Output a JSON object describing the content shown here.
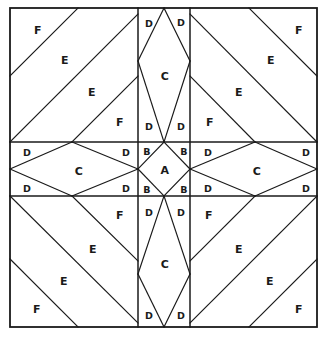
{
  "diagram": {
    "type": "quilt-block-template",
    "colors": {
      "line": "#1a1a1a",
      "background": "#ffffff",
      "label": "#1a1a1a"
    },
    "frame": {
      "x": 10,
      "y": 8,
      "width": 307,
      "height": 319
    },
    "grid": {
      "vertical_lines": [
        138,
        190
      ],
      "horizontal_lines": [
        142,
        196
      ],
      "columns": [
        10,
        138,
        190,
        317
      ],
      "rows": [
        8,
        142,
        196,
        327
      ]
    },
    "piece_types": [
      {
        "letter": "A",
        "count": 1,
        "shape": "center square on point"
      },
      {
        "letter": "B",
        "count": 4,
        "shape": "small corner triangle"
      },
      {
        "letter": "C",
        "count": 4,
        "shape": "long diamond"
      },
      {
        "letter": "D",
        "count": 16,
        "shape": "small triangle"
      },
      {
        "letter": "E",
        "count": 8,
        "shape": "large diagonal band"
      },
      {
        "letter": "F",
        "count": 8,
        "shape": "corner triangle"
      }
    ],
    "labels": [
      {
        "letter": "F",
        "x": 38,
        "y": 30,
        "size": "normal"
      },
      {
        "letter": "E",
        "x": 65,
        "y": 60,
        "size": "normal"
      },
      {
        "letter": "E",
        "x": 92,
        "y": 92,
        "size": "normal"
      },
      {
        "letter": "F",
        "x": 120,
        "y": 122,
        "size": "normal"
      },
      {
        "letter": "D",
        "x": 149,
        "y": 23,
        "size": "sm"
      },
      {
        "letter": "D",
        "x": 181,
        "y": 22,
        "size": "sm"
      },
      {
        "letter": "C",
        "x": 165,
        "y": 76,
        "size": "normal"
      },
      {
        "letter": "D",
        "x": 149,
        "y": 126,
        "size": "sm"
      },
      {
        "letter": "D",
        "x": 181,
        "y": 126,
        "size": "sm"
      },
      {
        "letter": "F",
        "x": 299,
        "y": 30,
        "size": "normal"
      },
      {
        "letter": "E",
        "x": 271,
        "y": 60,
        "size": "normal"
      },
      {
        "letter": "E",
        "x": 239,
        "y": 92,
        "size": "normal"
      },
      {
        "letter": "F",
        "x": 210,
        "y": 122,
        "size": "normal"
      },
      {
        "letter": "D",
        "x": 27,
        "y": 152,
        "size": "sm"
      },
      {
        "letter": "C",
        "x": 79,
        "y": 171,
        "size": "normal"
      },
      {
        "letter": "D",
        "x": 126,
        "y": 152,
        "size": "sm"
      },
      {
        "letter": "D",
        "x": 27,
        "y": 188,
        "size": "sm"
      },
      {
        "letter": "D",
        "x": 126,
        "y": 188,
        "size": "sm"
      },
      {
        "letter": "B",
        "x": 147,
        "y": 151,
        "size": "sm"
      },
      {
        "letter": "B",
        "x": 184,
        "y": 151,
        "size": "sm"
      },
      {
        "letter": "A",
        "x": 165,
        "y": 170,
        "size": "normal"
      },
      {
        "letter": "B",
        "x": 147,
        "y": 189,
        "size": "sm"
      },
      {
        "letter": "B",
        "x": 184,
        "y": 189,
        "size": "sm"
      },
      {
        "letter": "D",
        "x": 208,
        "y": 152,
        "size": "sm"
      },
      {
        "letter": "C",
        "x": 257,
        "y": 171,
        "size": "normal"
      },
      {
        "letter": "D",
        "x": 306,
        "y": 152,
        "size": "sm"
      },
      {
        "letter": "D",
        "x": 208,
        "y": 188,
        "size": "sm"
      },
      {
        "letter": "D",
        "x": 306,
        "y": 188,
        "size": "sm"
      },
      {
        "letter": "F",
        "x": 120,
        "y": 215,
        "size": "normal"
      },
      {
        "letter": "E",
        "x": 93,
        "y": 249,
        "size": "normal"
      },
      {
        "letter": "E",
        "x": 64,
        "y": 281,
        "size": "normal"
      },
      {
        "letter": "F",
        "x": 37,
        "y": 309,
        "size": "normal"
      },
      {
        "letter": "D",
        "x": 149,
        "y": 212,
        "size": "sm"
      },
      {
        "letter": "D",
        "x": 181,
        "y": 212,
        "size": "sm"
      },
      {
        "letter": "C",
        "x": 165,
        "y": 264,
        "size": "normal"
      },
      {
        "letter": "D",
        "x": 149,
        "y": 315,
        "size": "sm"
      },
      {
        "letter": "D",
        "x": 181,
        "y": 315,
        "size": "sm"
      },
      {
        "letter": "F",
        "x": 209,
        "y": 215,
        "size": "normal"
      },
      {
        "letter": "E",
        "x": 239,
        "y": 249,
        "size": "normal"
      },
      {
        "letter": "E",
        "x": 270,
        "y": 281,
        "size": "normal"
      },
      {
        "letter": "F",
        "x": 299,
        "y": 309,
        "size": "normal"
      }
    ]
  }
}
